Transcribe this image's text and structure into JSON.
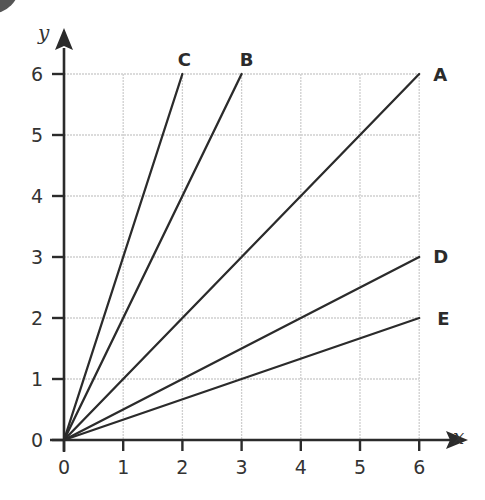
{
  "chart_data": {
    "type": "line",
    "title": "",
    "xlabel": "x",
    "ylabel": "y",
    "xlim": [
      0,
      6
    ],
    "ylim": [
      0,
      6
    ],
    "grid": true,
    "x_ticks": [
      0,
      1,
      2,
      3,
      4,
      5,
      6
    ],
    "y_ticks": [
      0,
      1,
      2,
      3,
      4,
      5,
      6
    ],
    "legend_position": "inline labels at line ends",
    "series": [
      {
        "name": "A",
        "points": [
          [
            0,
            0
          ],
          [
            6,
            6
          ]
        ],
        "slope": 1
      },
      {
        "name": "B",
        "points": [
          [
            0,
            0
          ],
          [
            3,
            6
          ]
        ],
        "slope": 2
      },
      {
        "name": "C",
        "points": [
          [
            0,
            0
          ],
          [
            2,
            6
          ]
        ],
        "slope": 3
      },
      {
        "name": "D",
        "points": [
          [
            0,
            0
          ],
          [
            6,
            3
          ]
        ],
        "slope": 0.5
      },
      {
        "name": "E",
        "points": [
          [
            0,
            0
          ],
          [
            6,
            2
          ]
        ],
        "slope": 0.3333
      }
    ]
  },
  "colors": {
    "line": "#2b2b2b",
    "axis": "#2b2b2b",
    "grid": "#cfcfcf",
    "text": "#333333"
  }
}
